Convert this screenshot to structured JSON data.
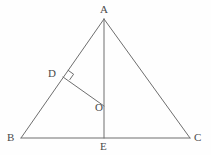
{
  "figure": {
    "kind": "geometry-diagram",
    "background_color": "#fefefe",
    "stroke_color": "#6e6e6e",
    "label_color": "#4a4a4a",
    "stroke_width": 1,
    "canvas": {
      "width": 211,
      "height": 155
    }
  },
  "points": {
    "A": {
      "label": "A",
      "x": 104,
      "y": 19,
      "label_x": 100,
      "label_y": 4
    },
    "B": {
      "label": "B",
      "x": 21,
      "y": 138,
      "label_x": 7,
      "label_y": 132
    },
    "C": {
      "label": "C",
      "x": 190,
      "y": 138,
      "label_x": 194,
      "label_y": 132
    },
    "D": {
      "label": "D",
      "x": 63,
      "y": 77,
      "label_x": 48,
      "label_y": 68
    },
    "E": {
      "label": "E",
      "x": 104,
      "y": 138,
      "label_x": 100,
      "label_y": 141
    },
    "O": {
      "label": "O",
      "x": 104,
      "y": 106,
      "label_x": 95,
      "label_y": 102
    }
  },
  "segments": [
    {
      "name": "side-AB",
      "from": "A",
      "to": "B"
    },
    {
      "name": "side-AC",
      "from": "A",
      "to": "C"
    },
    {
      "name": "base-BC",
      "from": "B",
      "to": "C"
    },
    {
      "name": "cevian-AE",
      "from": "A",
      "to": "E"
    },
    {
      "name": "segment-DO",
      "from": "D",
      "to": "O"
    }
  ],
  "right_angle_marks": [
    {
      "name": "right-angle-at-D",
      "vertex": "D",
      "size": 7
    }
  ],
  "labels": {
    "A": "A",
    "B": "B",
    "C": "C",
    "D": "D",
    "E": "E",
    "O": "O"
  }
}
